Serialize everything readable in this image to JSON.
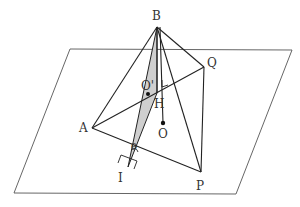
{
  "figure": {
    "labels": {
      "B": "B",
      "Q": "Q",
      "A": "A",
      "P": "P",
      "O": "O",
      "H": "H",
      "I": "I",
      "O_prime": "O'",
      "theta": "θ"
    },
    "colors": {
      "line": "#222222",
      "plane": "#555555",
      "shade": "#cfcfcf"
    }
  }
}
